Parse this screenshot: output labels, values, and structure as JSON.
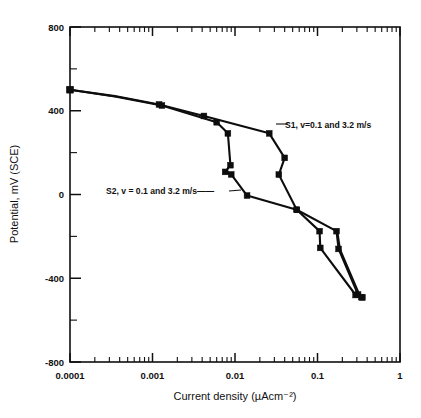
{
  "figure": {
    "background": "#ffffff",
    "ink_color": "#0d0d0d"
  },
  "axes": {
    "x": {
      "title": "Current density (µAcm⁻²)",
      "scale": "log",
      "min": 0.0001,
      "max": 1,
      "tick_labels": [
        "0.0001",
        "0.001",
        "0.01",
        "0.1",
        "1"
      ],
      "tick_values": [
        0.0001,
        0.001,
        0.01,
        0.1,
        1
      ]
    },
    "y": {
      "title": "Potential, mV (SCE)",
      "scale": "linear",
      "min": -800,
      "max": 800,
      "tick_labels": [
        "800",
        "400",
        "0",
        "-400",
        "-800"
      ],
      "tick_values": [
        800,
        400,
        0,
        -400,
        -800
      ],
      "minor_tick_values": [
        600,
        200,
        -200,
        -600
      ]
    }
  },
  "annotations": [
    {
      "id": "s1-label",
      "text": "S1, v=0.1   and 3.2 m/s",
      "x": 285,
      "y": 125
    },
    {
      "id": "s2-label",
      "text": "S2, v = 0.1   and 3.2 m/s——",
      "x": 106,
      "y": 193
    }
  ],
  "chart_data": {
    "type": "line",
    "title": "",
    "xlabel": "Current density (µAcm⁻²)",
    "ylabel": "Potential, mV (SCE)",
    "xscale": "log",
    "yscale": "linear",
    "xlim": [
      0.0001,
      1
    ],
    "ylim": [
      -800,
      800
    ],
    "grid": false,
    "legend": "inline-annotations",
    "x_tick_labels": [
      "0.0001",
      "0.001",
      "0.01",
      "0.1",
      "1"
    ],
    "y_tick_labels": [
      "800",
      "400",
      "0",
      "-400",
      "-800"
    ],
    "series": [
      {
        "name": "S1, v=0.1   and 3.2 m/s",
        "marker": "square",
        "points": [
          {
            "x": 0.0001,
            "y": 500
          },
          {
            "x": 0.00035,
            "y": 470
          },
          {
            "x": 0.0012,
            "y": 430
          },
          {
            "x": 0.0042,
            "y": 375
          },
          {
            "x": 0.026,
            "y": 292
          },
          {
            "x": 0.04,
            "y": 175
          },
          {
            "x": 0.034,
            "y": 95
          },
          {
            "x": 0.056,
            "y": -73
          },
          {
            "x": 0.106,
            "y": -175
          },
          {
            "x": 0.108,
            "y": -255
          },
          {
            "x": 0.29,
            "y": -480
          },
          {
            "x": 0.34,
            "y": -490
          }
        ]
      },
      {
        "name": "S2, v = 0.1   and 3.2 m/s",
        "marker": "square",
        "points": [
          {
            "x": 0.0001,
            "y": 500
          },
          {
            "x": 0.00035,
            "y": 468
          },
          {
            "x": 0.0013,
            "y": 425
          },
          {
            "x": 0.006,
            "y": 345
          },
          {
            "x": 0.0082,
            "y": 292
          },
          {
            "x": 0.0088,
            "y": 140
          },
          {
            "x": 0.0076,
            "y": 108
          },
          {
            "x": 0.009,
            "y": 96
          },
          {
            "x": 0.014,
            "y": -5
          },
          {
            "x": 0.056,
            "y": -73
          },
          {
            "x": 0.17,
            "y": -175
          },
          {
            "x": 0.18,
            "y": -260
          },
          {
            "x": 0.31,
            "y": -478
          },
          {
            "x": 0.35,
            "y": -492
          }
        ]
      },
      {
        "name": "S2 return branch",
        "marker": "none",
        "points": [
          {
            "x": 0.175,
            "y": -178
          },
          {
            "x": 0.188,
            "y": -262
          },
          {
            "x": 0.325,
            "y": -480
          }
        ]
      }
    ]
  }
}
